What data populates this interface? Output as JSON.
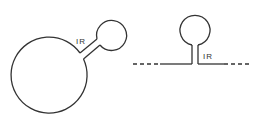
{
  "figure": {
    "left_panel": {
      "description": "circular molecule with inverted-repeat stem-loop",
      "label": "IR"
    },
    "right_panel": {
      "description": "linear molecule with inverted-repeat stem-loop",
      "label": "IR"
    },
    "colors": {
      "stroke": "#333333",
      "background": "#ffffff"
    }
  }
}
